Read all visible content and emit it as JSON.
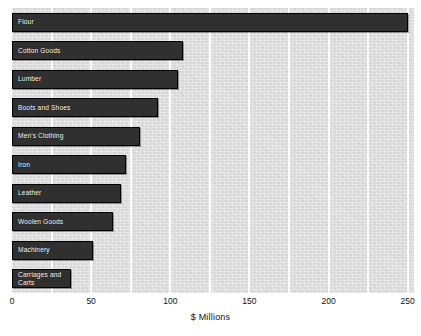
{
  "chart_data": {
    "type": "bar",
    "orientation": "horizontal",
    "title": "",
    "xlabel": "$ Millions",
    "ylabel": "",
    "xlim": [
      0,
      254
    ],
    "xticks": [
      0,
      50,
      100,
      150,
      200,
      250
    ],
    "xtick_labels": [
      "0",
      "50",
      "100",
      "150",
      "200",
      "250"
    ],
    "gridlines_x": [
      25,
      50,
      75,
      100,
      125,
      150,
      175,
      200,
      225,
      250
    ],
    "grid": true,
    "grid_color": "#ffffff",
    "legend": "none",
    "plot_background": "#dcdcdc",
    "bar_color": "#303030",
    "bar_edge_color": "#000000",
    "label_color": "#ffffff",
    "categories": [
      "Flour",
      "Cotton Goods",
      "Lumber",
      "Boots and Shoes",
      "Men's Clothing",
      "Iron",
      "Leather",
      "Woolen Goods",
      "Machinery",
      "Carriages and\nCarts"
    ],
    "values": [
      250,
      108,
      105,
      92,
      81,
      72,
      69,
      64,
      51,
      37
    ]
  }
}
